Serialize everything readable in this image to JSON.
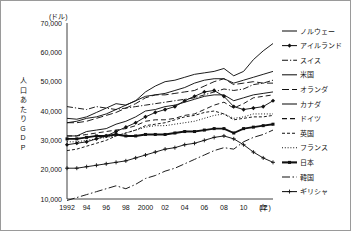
{
  "chart_data": {
    "type": "line",
    "title": "",
    "xlabel": "(年)",
    "ylabel": "人口あたりGDP",
    "yunit": "(ドル)",
    "ylim": [
      10000,
      70000
    ],
    "yticks": [
      10000,
      20000,
      30000,
      40000,
      50000,
      60000,
      70000
    ],
    "ytick_labels": [
      "10,000",
      "20,000",
      "30,000",
      "40,000",
      "50,000",
      "60,000",
      "70,000"
    ],
    "xlim": [
      1992,
      2013
    ],
    "x": [
      1992,
      1993,
      1994,
      1995,
      1996,
      1997,
      1998,
      1999,
      2000,
      2001,
      2002,
      2003,
      2004,
      2005,
      2006,
      2007,
      2008,
      2009,
      2010,
      2011,
      2012,
      2013
    ],
    "xticks": [
      1992,
      1994,
      1996,
      1998,
      2000,
      2002,
      2004,
      2006,
      2008,
      2010,
      2012
    ],
    "xtick_labels": [
      "1992",
      "94",
      "96",
      "98",
      "2000",
      "02",
      "04",
      "06",
      "08",
      "10",
      "12"
    ],
    "grid": false,
    "legend_position": "right",
    "series": [
      {
        "name": "ノルウェー",
        "style": "solid",
        "marker": "none",
        "values": [
          37500,
          37200,
          38000,
          39500,
          41000,
          42500,
          42000,
          43500,
          46500,
          48500,
          50000,
          50500,
          51500,
          52500,
          53000,
          53500,
          54500,
          52000,
          53500,
          57500,
          60500,
          63000
        ]
      },
      {
        "name": "アイルランド",
        "style": "solid",
        "marker": "diamond",
        "values": [
          28500,
          29000,
          29500,
          30500,
          31500,
          33000,
          34500,
          36000,
          38000,
          39500,
          40500,
          41500,
          43500,
          45000,
          46500,
          47000,
          45000,
          41500,
          40500,
          41000,
          41500,
          43500
        ]
      },
      {
        "name": "スイス",
        "style": "dash-dot-short",
        "marker": "none",
        "values": [
          41500,
          41000,
          40500,
          41500,
          41000,
          40500,
          41000,
          41500,
          42000,
          42500,
          43000,
          43500,
          44000,
          44500,
          45500,
          46500,
          47500,
          47000,
          47500,
          49000,
          49500,
          50500
        ]
      },
      {
        "name": "米国",
        "style": "solid",
        "marker": "none",
        "values": [
          36000,
          36500,
          37500,
          38000,
          39000,
          40500,
          42000,
          43500,
          45000,
          45500,
          46000,
          47000,
          48000,
          49500,
          50500,
          51000,
          51000,
          49500,
          50500,
          51500,
          52500,
          53500
        ]
      },
      {
        "name": "オランダ",
        "style": "dashed-long",
        "marker": "none",
        "values": [
          36000,
          36000,
          36500,
          37500,
          38500,
          39500,
          41000,
          42500,
          44500,
          45500,
          45500,
          46000,
          46500,
          47000,
          48500,
          50000,
          51000,
          49000,
          49500,
          50000,
          49500,
          49500
        ]
      },
      {
        "name": "カナダ",
        "style": "solid",
        "marker": "none",
        "values": [
          31500,
          31500,
          33000,
          33500,
          34000,
          35500,
          36500,
          38000,
          40000,
          40500,
          41500,
          42000,
          43000,
          44000,
          45000,
          45500,
          45500,
          43500,
          44500,
          45500,
          46000,
          46500
        ]
      },
      {
        "name": "ドイツ",
        "style": "dashed-med",
        "marker": "none",
        "values": [
          31500,
          31500,
          32000,
          32500,
          33000,
          33500,
          34000,
          35000,
          36500,
          37000,
          37000,
          37500,
          38500,
          39000,
          40500,
          42000,
          43000,
          41000,
          42500,
          44500,
          45000,
          45500
        ]
      },
      {
        "name": "英国",
        "style": "dashed-short",
        "marker": "none",
        "values": [
          26500,
          27000,
          28000,
          29000,
          30000,
          31500,
          32500,
          33500,
          35000,
          35500,
          36000,
          37000,
          38000,
          38500,
          39500,
          40000,
          39000,
          37000,
          37500,
          38000,
          38000,
          38500
        ]
      },
      {
        "name": "フランス",
        "style": "dotted",
        "marker": "none",
        "values": [
          29500,
          29500,
          30000,
          30500,
          31000,
          31500,
          32500,
          33500,
          34500,
          35000,
          35000,
          35500,
          36000,
          36500,
          37500,
          38500,
          39000,
          37500,
          38000,
          39000,
          39000,
          39000
        ]
      },
      {
        "name": "日本",
        "style": "solid-thick",
        "marker": "square",
        "values": [
          30500,
          30500,
          31000,
          31500,
          31500,
          32000,
          31500,
          31500,
          32000,
          32000,
          32000,
          32500,
          33000,
          33000,
          33500,
          34000,
          34000,
          32500,
          34000,
          34500,
          35000,
          35500
        ]
      },
      {
        "name": "韓国",
        "style": "dash-dot-long",
        "marker": "none",
        "values": [
          9500,
          10500,
          11500,
          12500,
          13500,
          14500,
          13500,
          15000,
          17000,
          18000,
          19500,
          20500,
          22000,
          23500,
          25000,
          26500,
          27500,
          27000,
          29500,
          31000,
          32000,
          33500
        ]
      },
      {
        "name": "ギリシャ",
        "style": "solid",
        "marker": "plus",
        "values": [
          20500,
          20500,
          21000,
          21500,
          22000,
          22500,
          23000,
          24000,
          25000,
          26000,
          27000,
          27500,
          28500,
          29000,
          30000,
          31000,
          31500,
          30500,
          28500,
          26000,
          24000,
          22500
        ]
      }
    ]
  }
}
